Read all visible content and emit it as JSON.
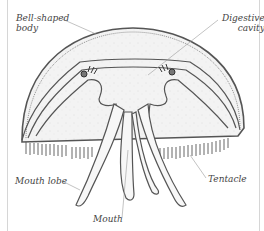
{
  "diagram": {
    "labels": {
      "bell_body_line1": "Bell-shaped",
      "bell_body_line2": "body",
      "digestive_line1": "Digestive",
      "digestive_line2": "cavity",
      "mouth_lobe": "Mouth lobe",
      "tentacle": "Tentacle",
      "mouth": "Mouth"
    },
    "colors": {
      "ink": "#444444",
      "bell_fill": "#f2f2f2",
      "leader_line": "#9a9a9a",
      "frame": "#d6d6d6"
    }
  }
}
